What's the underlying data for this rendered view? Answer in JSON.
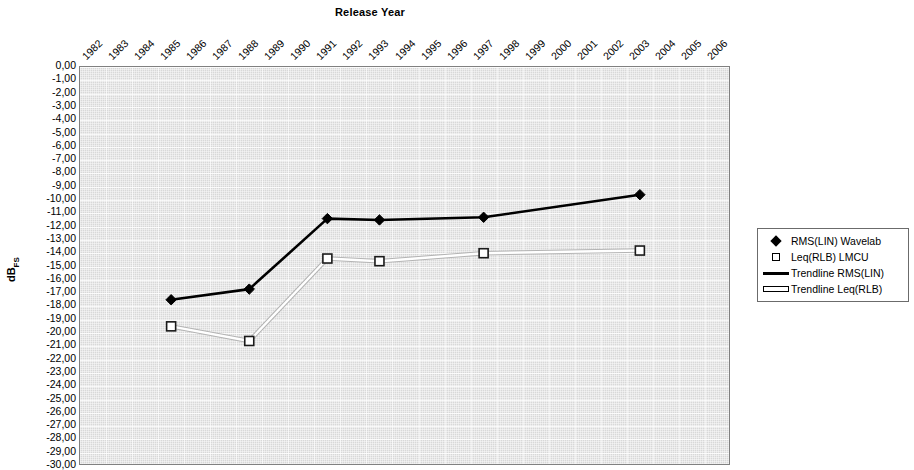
{
  "chart_data": {
    "type": "line",
    "title": "Release Year",
    "xlabel": "Release Year",
    "ylabel": "dBFS",
    "ylabel_base": "dB",
    "ylabel_sub": "FS",
    "xlim_categories": [
      "1982",
      "1983",
      "1984",
      "1985",
      "1986",
      "1987",
      "1988",
      "1989",
      "1990",
      "1991",
      "1992",
      "1993",
      "1994",
      "1995",
      "1996",
      "1997",
      "1998",
      "1999",
      "2000",
      "2001",
      "2002",
      "2003",
      "2004",
      "2005",
      "2006"
    ],
    "ylim": [
      -30,
      0
    ],
    "ytick_step": 1,
    "yticks": [
      "0,00",
      "-1,00",
      "-2,00",
      "-3,00",
      "-4,00",
      "-5,00",
      "-6,00",
      "-7,00",
      "-8,00",
      "-9,00",
      "-10,00",
      "-11,00",
      "-12,00",
      "-13,00",
      "-14,00",
      "-15,00",
      "-16,00",
      "-17,00",
      "-18,00",
      "-19,00",
      "-20,00",
      "-21,00",
      "-22,00",
      "-23,00",
      "-24,00",
      "-25,00",
      "-26,00",
      "-27,00",
      "-28,00",
      "-29,00",
      "-30,00"
    ],
    "grid": true,
    "legend_position": "right",
    "x": [
      "1985",
      "1988",
      "1991",
      "1993",
      "1997",
      "2003"
    ],
    "series": [
      {
        "name": "RMS(LIN) Wavelab",
        "marker": "diamond",
        "color": "#000000",
        "values": [
          -17.5,
          -16.7,
          -11.4,
          -11.5,
          -11.3,
          -9.6
        ]
      },
      {
        "name": "Leq(RLB) LMCU",
        "marker": "square",
        "color": "#ffffff",
        "values": [
          -19.5,
          -20.6,
          -14.4,
          -14.6,
          -14.0,
          -13.8
        ]
      }
    ],
    "trendlines": [
      {
        "name": "Trendline RMS(LIN)",
        "color": "#000000"
      },
      {
        "name": "Trendline Leq(RLB)",
        "color": "#ffffff"
      }
    ]
  },
  "legend": {
    "items": [
      {
        "label": "RMS(LIN) Wavelab",
        "key": "diamond-marker"
      },
      {
        "label": "Leq(RLB) LMCU",
        "key": "square-marker"
      },
      {
        "label": "Trendline RMS(LIN)",
        "key": "black-line"
      },
      {
        "label": "Trendline Leq(RLB)",
        "key": "white-line"
      }
    ]
  }
}
